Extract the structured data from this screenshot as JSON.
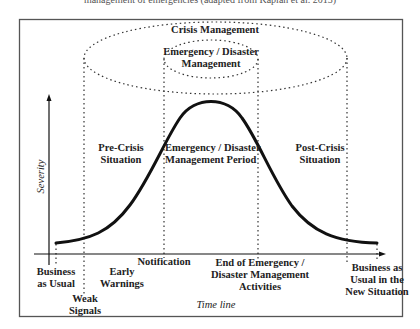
{
  "diagram": {
    "top_cut_text": "management of emergencies (adapted from Kaplan et al. 2013)",
    "ellipses": {
      "outer_label": "Crisis Management",
      "inner_label_line1": "Emergency / Disaster",
      "inner_label_line2": "Management"
    },
    "axes": {
      "y_label": "Severity",
      "x_label": "Time line"
    },
    "regions": {
      "pre_crisis_line1": "Pre-Crisis",
      "pre_crisis_line2": "Situation",
      "emergency_period_line1": "Emergency / Disaster",
      "emergency_period_line2": "Management Period",
      "post_crisis_line1": "Post-Crisis",
      "post_crisis_line2": "Situation"
    },
    "timeline_events": {
      "business_as_usual_line1": "Business",
      "business_as_usual_line2": "as Usual",
      "weak_signals_line1": "Weak",
      "weak_signals_line2": "Signals",
      "early_warnings_line1": "Early",
      "early_warnings_line2": "Warnings",
      "notification": "Notification",
      "end_of_emergency_line1": "End of Emergency /",
      "end_of_emergency_line2": "Disaster Management",
      "end_of_emergency_line3": "Activities",
      "new_situation_line1": "Business as",
      "new_situation_line2": "Usual in the",
      "new_situation_line3": "New Situation"
    },
    "colors": {
      "stroke": "#111111",
      "border": "#555555",
      "dots": "#333333"
    }
  }
}
